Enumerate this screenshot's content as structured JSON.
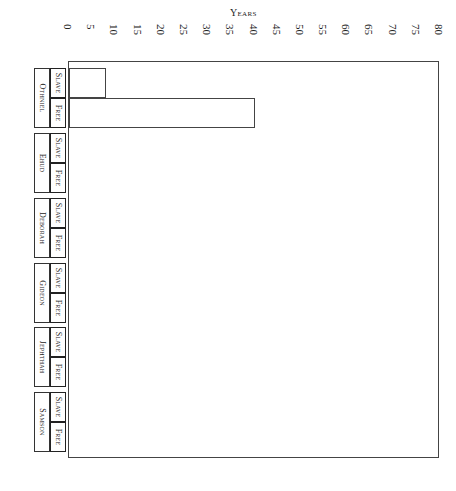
{
  "chart_data": {
    "type": "bar",
    "orientation": "horizontal",
    "title": "",
    "xlabel": "Years",
    "ylabel": "",
    "xlim": [
      0,
      80
    ],
    "x_ticks": [
      "0",
      "5",
      "10",
      "15",
      "20",
      "25",
      "30",
      "35",
      "40",
      "45",
      "50",
      "55",
      "60",
      "65",
      "70",
      "75",
      "80"
    ],
    "categories": [
      "Othniel",
      "Ehud",
      "Deborah",
      "Gideon",
      "Jephthah",
      "Samson"
    ],
    "subcategories": [
      "Slave",
      "Free"
    ],
    "series": [
      {
        "name": "Slave",
        "values": [
          8,
          null,
          null,
          null,
          null,
          null
        ]
      },
      {
        "name": "Free",
        "values": [
          40,
          null,
          null,
          null,
          null,
          null
        ]
      }
    ],
    "grid": false,
    "legend": "none"
  },
  "axis": {
    "title": "Years"
  },
  "groups": [
    {
      "name": "Othniel",
      "slave": "Slave",
      "free": "Free"
    },
    {
      "name": "Ehud",
      "slave": "Slave",
      "free": "Free"
    },
    {
      "name": "Deborah",
      "slave": "Slave",
      "free": "Free"
    },
    {
      "name": "Gideon",
      "slave": "Slave",
      "free": "Free"
    },
    {
      "name": "Jephthah",
      "slave": "Slave",
      "free": "Free"
    },
    {
      "name": "Samson",
      "slave": "Slave",
      "free": "Free"
    }
  ]
}
